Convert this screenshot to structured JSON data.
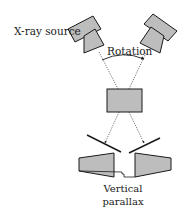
{
  "labels": {
    "source": "X-ray source",
    "rotation": "Rotation",
    "parallax_line1": "Vertical",
    "parallax_line2": "parallax"
  },
  "colors": {
    "fill": "#bdbdbd",
    "stroke": "#1a1a1a",
    "background": "#ffffff"
  }
}
